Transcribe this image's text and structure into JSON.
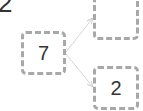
{
  "heading": "2",
  "diagram": {
    "root": {
      "value": "7"
    },
    "children": [
      {
        "value": ""
      },
      {
        "value": "2"
      }
    ],
    "colors": {
      "box_border": "#a8a8a8",
      "arrow": "#d6d6d6",
      "text": "#333333"
    }
  }
}
